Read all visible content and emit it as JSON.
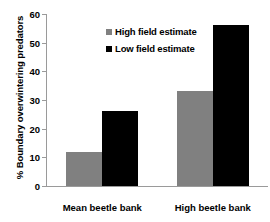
{
  "chart_data": {
    "type": "bar",
    "title": "",
    "xlabel": "",
    "ylabel": "% Boundary overwintering predators",
    "categories": [
      "Mean beetle bank",
      "High beetle bank"
    ],
    "series": [
      {
        "name": "High field estimate",
        "color": "#808080",
        "values": [
          12,
          33
        ]
      },
      {
        "name": "Low field estimate",
        "color": "#000000",
        "values": [
          26,
          56
        ]
      }
    ],
    "ylim": [
      0,
      60
    ],
    "yticks": [
      0,
      10,
      20,
      30,
      40,
      50,
      60
    ],
    "ytick_labels": [
      "0",
      "10",
      "20",
      "30",
      "40",
      "50",
      "60"
    ],
    "grid": false,
    "legend_position": "top-left-inside",
    "axis_color": "#9a9a9a"
  }
}
